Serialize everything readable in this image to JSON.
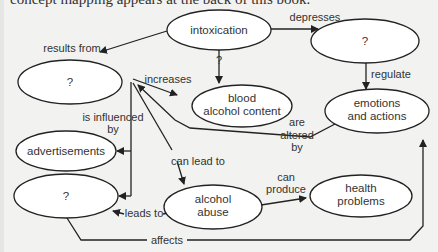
{
  "header": {
    "text": "concept mapping appears at the back of this book."
  },
  "nodes": {
    "intoxication": "intoxication",
    "q_top_right": "?",
    "q_left": "?",
    "blood_1": "blood",
    "blood_2": "alcohol content",
    "emotions_1": "emotions",
    "emotions_2": "and actions",
    "advertisements": "advertisements",
    "q_lower_left": "?",
    "abuse_1": "alcohol",
    "abuse_2": "abuse",
    "health_1": "health",
    "health_2": "problems"
  },
  "links": {
    "results_from": "results from",
    "depresses": "depresses",
    "q_link": "?",
    "increases": "increases",
    "regulate": "regulate",
    "are": "are",
    "altered": "altered",
    "by": "by",
    "is_influenced": "is influenced",
    "by2": "by",
    "can_lead_to": "can lead to",
    "can": "can",
    "produce": "produce",
    "leads_to": "leads to",
    "affects": "affects"
  }
}
